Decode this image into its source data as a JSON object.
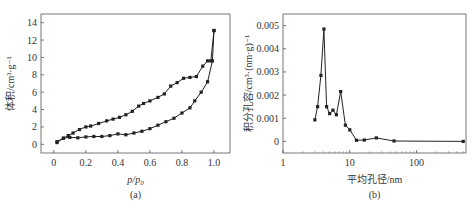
{
  "chart_data": [
    {
      "type": "line",
      "panel_label": "(a)",
      "title": "",
      "xlabel": "p/p0",
      "ylabel": "体积/cm³·g⁻¹",
      "xlim": [
        -0.08,
        1.1
      ],
      "ylim": [
        -1,
        15
      ],
      "xticks": [
        0,
        0.2,
        0.4,
        0.6,
        0.8,
        1.0
      ],
      "xtick_labels": [
        "0",
        "0.2",
        "0.4",
        "0.6",
        "0.8",
        "1.0"
      ],
      "yticks": [
        0,
        2,
        4,
        6,
        8,
        10,
        12,
        14
      ],
      "ytick_labels": [
        "0",
        "2",
        "4",
        "6",
        "8",
        "10",
        "12",
        "14"
      ],
      "grid": false,
      "legend": null,
      "series": [
        {
          "name": "adsorption",
          "marker": "square",
          "x": [
            0.02,
            0.06,
            0.1,
            0.15,
            0.2,
            0.25,
            0.3,
            0.35,
            0.4,
            0.45,
            0.5,
            0.55,
            0.6,
            0.65,
            0.7,
            0.75,
            0.8,
            0.85,
            0.88,
            0.92,
            0.96,
            0.99,
            1.0
          ],
          "y": [
            0.2,
            0.7,
            0.8,
            0.75,
            0.85,
            0.9,
            0.9,
            1.0,
            1.2,
            1.1,
            1.3,
            1.5,
            1.8,
            2.2,
            2.6,
            3.0,
            3.6,
            4.2,
            5.0,
            6.0,
            7.2,
            9.6,
            13.1
          ]
        },
        {
          "name": "desorption",
          "marker": "square",
          "x": [
            1.0,
            0.98,
            0.96,
            0.93,
            0.89,
            0.85,
            0.81,
            0.77,
            0.73,
            0.69,
            0.65,
            0.6,
            0.56,
            0.53,
            0.49,
            0.45,
            0.41,
            0.37,
            0.33,
            0.28,
            0.23,
            0.2,
            0.16,
            0.12,
            0.09,
            0.06,
            0.02
          ],
          "y": [
            13.1,
            9.6,
            9.6,
            9.0,
            7.8,
            7.7,
            7.6,
            7.1,
            6.7,
            5.8,
            5.4,
            5.0,
            4.7,
            4.4,
            3.8,
            3.4,
            3.1,
            2.9,
            2.7,
            2.4,
            2.1,
            2.0,
            1.7,
            1.3,
            1.0,
            0.7,
            0.3
          ]
        }
      ]
    },
    {
      "type": "line",
      "panel_label": "(b)",
      "title": "",
      "xlabel": "平均孔径/nm",
      "ylabel": "积分孔容/cm³·(nm·g)⁻¹",
      "xscale": "log",
      "xlim": [
        1,
        550
      ],
      "ylim": [
        -0.0005,
        0.0055
      ],
      "xticks": [
        1,
        10,
        100
      ],
      "xtick_labels": [
        "1",
        "10",
        "100"
      ],
      "yticks": [
        0,
        0.001,
        0.002,
        0.003,
        0.004,
        0.005
      ],
      "ytick_labels": [
        "0",
        "0.001",
        "0.002",
        "0.003",
        "0.004",
        "0.005"
      ],
      "grid": false,
      "legend": null,
      "series": [
        {
          "name": "pore size distribution",
          "marker": "square",
          "x": [
            3.0,
            3.3,
            3.7,
            4.1,
            4.5,
            5.0,
            5.6,
            6.3,
            7.3,
            8.6,
            10,
            12.6,
            16.5,
            25,
            46,
            500
          ],
          "y": [
            0.00093,
            0.0015,
            0.00285,
            0.00485,
            0.0015,
            0.0012,
            0.00135,
            0.00115,
            0.00215,
            0.0007,
            0.0005,
            5e-05,
            6e-05,
            0.00015,
            2e-05,
            0.0
          ]
        }
      ]
    }
  ]
}
